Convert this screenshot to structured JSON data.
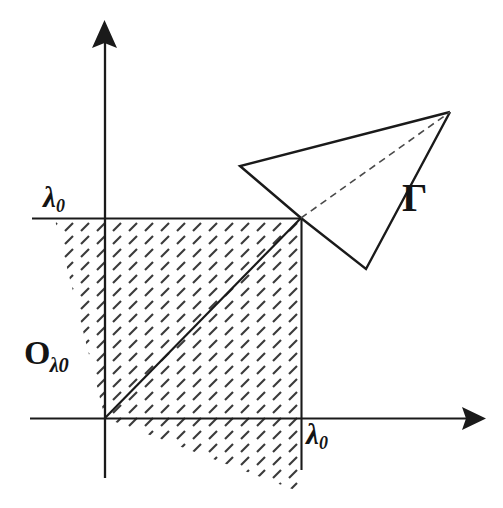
{
  "figure": {
    "kind": "math-diagram",
    "background_color": "#ffffff",
    "ink_color": "#1a1a1a",
    "hatch_color": "#3a3a3a"
  },
  "labels": {
    "lambda0_y_axis": {
      "base": "λ",
      "sub": "0"
    },
    "lambda0_x_axis": {
      "base": "λ",
      "sub": "0"
    },
    "omega_region": {
      "base": "O",
      "sub": "λ0"
    },
    "gamma_cone": {
      "text": "Γ"
    }
  },
  "geometry": {
    "origin": {
      "x": 105,
      "y": 418
    },
    "corner_point": {
      "x": 301,
      "y": 218
    },
    "axes": {
      "x_axis": {
        "x1": 30,
        "y1": 418,
        "x2": 472,
        "y2": 418,
        "arrow": "right",
        "arrow_tip_x": 486
      },
      "y_axis": {
        "x1": 105,
        "y1": 478,
        "x2": 105,
        "y2": 36,
        "arrow": "up",
        "arrow_tip_y": 20
      }
    },
    "guide_lines": [
      {
        "name": "horizontal-lambda0",
        "x1": 32,
        "y1": 218,
        "x2": 301,
        "y2": 218
      },
      {
        "name": "vertical-lambda0",
        "x1": 301,
        "y1": 218,
        "x2": 301,
        "y2": 470
      },
      {
        "name": "diagonal-origin-to-corner",
        "x1": 105,
        "y1": 418,
        "x2": 301,
        "y2": 218
      }
    ],
    "shaded_region_polygon": [
      {
        "x": 55,
        "y": 220
      },
      {
        "x": 301,
        "y": 220
      },
      {
        "x": 301,
        "y": 492
      },
      {
        "x": 300,
        "y": 492
      },
      {
        "x": 105,
        "y": 418
      }
    ],
    "cone_gamma": {
      "apex": {
        "x": 301,
        "y": 218
      },
      "upper_left_vertex": {
        "x": 240,
        "y": 166
      },
      "far_right_vertex": {
        "x": 450,
        "y": 112
      },
      "lower_vertex": {
        "x": 366,
        "y": 269
      },
      "dashed_axis_line": {
        "from": {
          "x": 301,
          "y": 218
        },
        "to": {
          "x": 450,
          "y": 112
        }
      }
    }
  }
}
